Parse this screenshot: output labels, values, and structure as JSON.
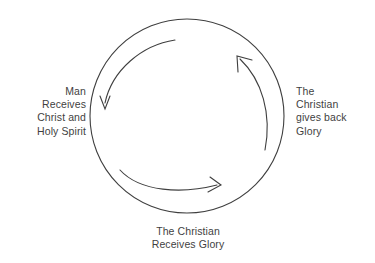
{
  "diagram": {
    "type": "circular-cycle",
    "background_color": "#ffffff",
    "stroke_color": "#3f3f3f",
    "text_color": "#3f3f3f",
    "circle": {
      "center_x": 187,
      "center_y": 116,
      "radius": 97
    },
    "labels": {
      "left": "Man\nReceives\nChrist and\nHoly Spirit",
      "right": "The\nChristian\ngives back\nGlory",
      "bottom": "The Christian\nReceives Glory"
    },
    "arrows": [
      {
        "name": "left-descending-arrow",
        "from_label": "top",
        "to_label": "left",
        "direction": "counterclockwise-down"
      },
      {
        "name": "bottom-rightward-arrow",
        "from_label": "left-lower",
        "to_label": "bottom-right",
        "direction": "clockwise-right"
      },
      {
        "name": "right-ascending-arrow",
        "from_label": "right-lower",
        "to_label": "top-right",
        "direction": "counterclockwise-up"
      }
    ]
  }
}
